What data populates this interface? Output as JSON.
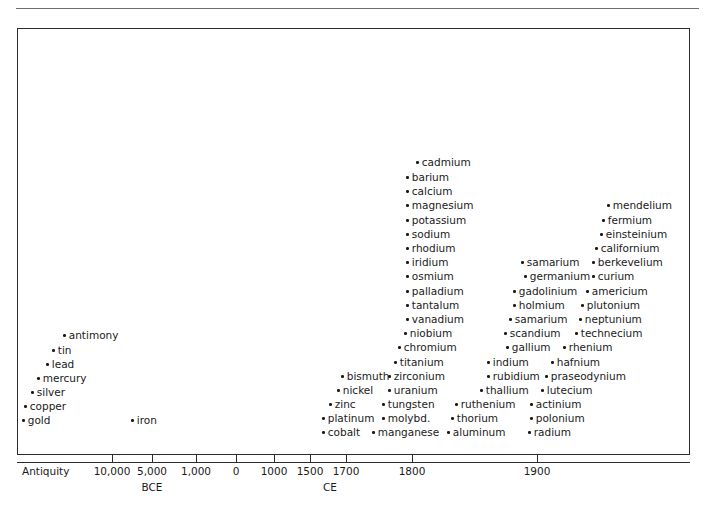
{
  "header": {
    "fragment": ""
  },
  "chart_data": {
    "type": "scatter",
    "title": "",
    "xlabel": "",
    "ylabel": "",
    "grid": false,
    "legend": null,
    "axis": {
      "ticks": [
        {
          "label": "Antiquity",
          "x": 22,
          "anchor": "left",
          "tick": false
        },
        {
          "label": "10,000",
          "x": 112,
          "anchor": "center",
          "tick": true
        },
        {
          "label": "5,000",
          "x": 152,
          "anchor": "center",
          "tick": true
        },
        {
          "label": "1,000",
          "x": 196,
          "anchor": "center",
          "tick": true
        },
        {
          "label": "0",
          "x": 236,
          "anchor": "center",
          "tick": true
        },
        {
          "label": "1000",
          "x": 274,
          "anchor": "center",
          "tick": true
        },
        {
          "label": "1500",
          "x": 310,
          "anchor": "center",
          "tick": true
        },
        {
          "label": "1700",
          "x": 346,
          "anchor": "center",
          "tick": true
        },
        {
          "label": "1800",
          "x": 412,
          "anchor": "center",
          "tick": true
        },
        {
          "label": "1900",
          "x": 537,
          "anchor": "center",
          "tick": true
        }
      ],
      "eras": [
        {
          "label": "BCE",
          "x": 152
        },
        {
          "label": "CE",
          "x": 330
        }
      ]
    },
    "points": [
      {
        "label": "antiquity-cluster-antimony",
        "name": "antimony",
        "x": 63,
        "y": 330
      },
      {
        "label": "antiquity-cluster-tin",
        "name": "tin",
        "x": 52,
        "y": 345
      },
      {
        "label": "antiquity-cluster-lead",
        "name": "lead",
        "x": 46,
        "y": 359
      },
      {
        "label": "antiquity-cluster-mercury",
        "name": "mercury",
        "x": 37,
        "y": 373
      },
      {
        "label": "antiquity-cluster-silver",
        "name": "silver",
        "x": 31,
        "y": 387
      },
      {
        "label": "antiquity-cluster-copper",
        "name": "copper",
        "x": 24,
        "y": 401
      },
      {
        "label": "antiquity-cluster-gold",
        "name": "gold",
        "x": 22,
        "y": 415
      },
      {
        "label": "iron",
        "name": "iron",
        "x": 131,
        "y": 415
      },
      {
        "label": "cadmium",
        "name": "cadmium",
        "x": 416,
        "y": 157
      },
      {
        "label": "barium",
        "name": "barium",
        "x": 406,
        "y": 172
      },
      {
        "label": "calcium",
        "name": "calcium",
        "x": 406,
        "y": 186
      },
      {
        "label": "magnesium",
        "name": "magnesium",
        "x": 406,
        "y": 200
      },
      {
        "label": "potassium",
        "name": "potassium",
        "x": 406,
        "y": 215
      },
      {
        "label": "sodium",
        "name": "sodium",
        "x": 406,
        "y": 229
      },
      {
        "label": "rhodium",
        "name": "rhodium",
        "x": 406,
        "y": 243
      },
      {
        "label": "iridium",
        "name": "iridium",
        "x": 406,
        "y": 257
      },
      {
        "label": "osmium",
        "name": "osmium",
        "x": 406,
        "y": 271
      },
      {
        "label": "palladium",
        "name": "palladium",
        "x": 406,
        "y": 286
      },
      {
        "label": "tantalum",
        "name": "tantalum",
        "x": 406,
        "y": 300
      },
      {
        "label": "vanadium",
        "name": "vanadium",
        "x": 406,
        "y": 314
      },
      {
        "label": "niobium",
        "name": "niobium",
        "x": 404,
        "y": 328
      },
      {
        "label": "chromium",
        "name": "chromium",
        "x": 398,
        "y": 342
      },
      {
        "label": "titanium",
        "name": "titanium",
        "x": 394,
        "y": 357
      },
      {
        "label": "zirconium",
        "name": "zirconium",
        "x": 388,
        "y": 371
      },
      {
        "label": "uranium",
        "name": "uranium",
        "x": 388,
        "y": 385
      },
      {
        "label": "tungsten",
        "name": "tungsten",
        "x": 382,
        "y": 399
      },
      {
        "label": "molybdenum",
        "name": "molybd.",
        "x": 382,
        "y": 413
      },
      {
        "label": "manganese",
        "name": "manganese",
        "x": 372,
        "y": 427
      },
      {
        "label": "bismuth",
        "name": "bismuth",
        "x": 341,
        "y": 371
      },
      {
        "label": "nickel",
        "name": "nickel",
        "x": 337,
        "y": 385
      },
      {
        "label": "zinc",
        "name": "zinc",
        "x": 329,
        "y": 399
      },
      {
        "label": "platinum",
        "name": "platinum",
        "x": 322,
        "y": 413
      },
      {
        "label": "cobalt",
        "name": "cobalt",
        "x": 322,
        "y": 427
      },
      {
        "label": "samarium-1",
        "name": "samarium",
        "x": 521,
        "y": 257
      },
      {
        "label": "germanium",
        "name": "germanium",
        "x": 524,
        "y": 271
      },
      {
        "label": "gadolinium",
        "name": "gadolinium",
        "x": 513,
        "y": 286
      },
      {
        "label": "holmium",
        "name": "holmium",
        "x": 513,
        "y": 300
      },
      {
        "label": "samarium-2",
        "name": "samarium",
        "x": 509,
        "y": 314
      },
      {
        "label": "scandium",
        "name": "scandium",
        "x": 504,
        "y": 328
      },
      {
        "label": "gallium",
        "name": "gallium",
        "x": 506,
        "y": 342
      },
      {
        "label": "indium",
        "name": "indium",
        "x": 487,
        "y": 357
      },
      {
        "label": "rubidium",
        "name": "rubidium",
        "x": 487,
        "y": 371
      },
      {
        "label": "thallium",
        "name": "thallium",
        "x": 480,
        "y": 385
      },
      {
        "label": "ruthenium",
        "name": "ruthenium",
        "x": 455,
        "y": 399
      },
      {
        "label": "thorium",
        "name": "thorium",
        "x": 451,
        "y": 413
      },
      {
        "label": "aluminum",
        "name": "aluminum",
        "x": 447,
        "y": 427
      },
      {
        "label": "mendelium",
        "name": "mendelium",
        "x": 607,
        "y": 200
      },
      {
        "label": "fermium",
        "name": "fermium",
        "x": 602,
        "y": 215
      },
      {
        "label": "einsteinium",
        "name": "einsteinium",
        "x": 600,
        "y": 229
      },
      {
        "label": "californium",
        "name": "californium",
        "x": 595,
        "y": 243
      },
      {
        "label": "berkevelium",
        "name": "berkevelium",
        "x": 592,
        "y": 257
      },
      {
        "label": "curium",
        "name": "curium",
        "x": 592,
        "y": 271
      },
      {
        "label": "americium",
        "name": "americium",
        "x": 586,
        "y": 286
      },
      {
        "label": "plutonium",
        "name": "plutonium",
        "x": 581,
        "y": 300
      },
      {
        "label": "neptunium",
        "name": "neptunium",
        "x": 579,
        "y": 314
      },
      {
        "label": "technecium",
        "name": "technecium",
        "x": 575,
        "y": 328
      },
      {
        "label": "rhenium",
        "name": "rhenium",
        "x": 563,
        "y": 342
      },
      {
        "label": "hafnium",
        "name": "hafnium",
        "x": 551,
        "y": 357
      },
      {
        "label": "praseodynium",
        "name": "praseodynium",
        "x": 545,
        "y": 371
      },
      {
        "label": "lutecium",
        "name": "lutecium",
        "x": 541,
        "y": 385
      },
      {
        "label": "actinium",
        "name": "actinium",
        "x": 530,
        "y": 399
      },
      {
        "label": "polonium",
        "name": "polonium",
        "x": 530,
        "y": 413
      },
      {
        "label": "radium",
        "name": "radium",
        "x": 528,
        "y": 427
      }
    ]
  }
}
